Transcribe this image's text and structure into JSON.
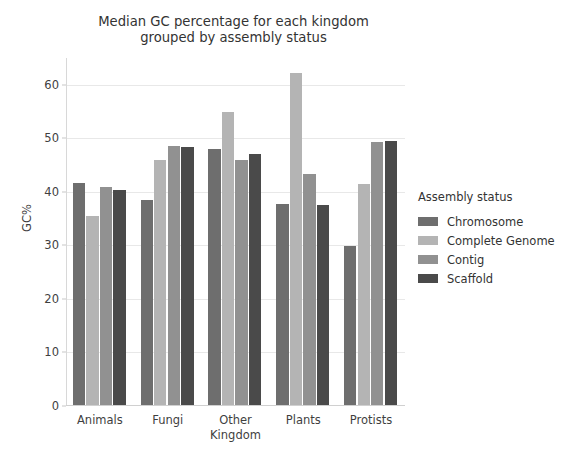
{
  "chart_data": {
    "type": "bar",
    "title": "Median GC percentage for each kingdom\ngrouped by assembly status",
    "xlabel": "Kingdom",
    "ylabel": "GC%",
    "categories": [
      "Animals",
      "Fungi",
      "Other",
      "Plants",
      "Protists"
    ],
    "series": [
      {
        "name": "Chromosome",
        "color": "#6e6e6e",
        "values": [
          41.7,
          38.4,
          48.0,
          37.8,
          29.8
        ]
      },
      {
        "name": "Complete Genome",
        "color": "#b4b4b4",
        "values": [
          35.5,
          46.0,
          55.0,
          62.2,
          41.5
        ]
      },
      {
        "name": "Contig",
        "color": "#919191",
        "values": [
          41.0,
          48.5,
          46.0,
          43.3,
          49.4
        ]
      },
      {
        "name": "Scaffold",
        "color": "#4a4a4a",
        "values": [
          40.3,
          48.4,
          47.0,
          37.6,
          49.5
        ]
      }
    ],
    "ylim": [
      0,
      65
    ],
    "yticks": [
      0,
      10,
      20,
      30,
      40,
      50,
      60
    ],
    "ytick_labels": [
      "0",
      "10",
      "20",
      "30",
      "40",
      "50",
      "60"
    ],
    "grid": true,
    "grid_color": "#e8e8e8",
    "legend": {
      "title": "Assembly status",
      "position": "right",
      "entries": [
        "Chromosome",
        "Complete Genome",
        "Contig",
        "Scaffold"
      ]
    },
    "background": "#ffffff"
  }
}
